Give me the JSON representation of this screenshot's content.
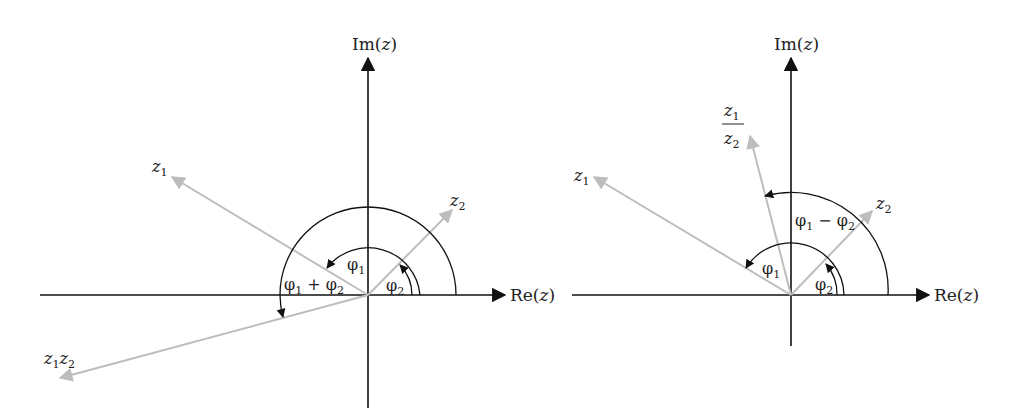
{
  "colors": {
    "axis": "#111111",
    "vector": "#bdbdbd",
    "arc": "#111111",
    "background": "#ffffff"
  },
  "left": {
    "title": "Multiplication of complex numbers",
    "axes": {
      "im_label": "Im(z)",
      "re_label": ""
    },
    "vectors": [
      {
        "name": "z1",
        "label": "z",
        "sub": "1"
      },
      {
        "name": "z2",
        "label": "z",
        "sub": "2"
      },
      {
        "name": "z1z2",
        "label": "z",
        "sub": "1",
        "label2": "z",
        "sub2": "2"
      }
    ],
    "angles": [
      {
        "name": "phi1",
        "label": "φ",
        "sub": "1"
      },
      {
        "name": "phi2",
        "label": "φ",
        "sub": "2"
      },
      {
        "name": "phi1_plus_phi2",
        "label": "φ",
        "sub": "1",
        "op": " + ",
        "label2": "φ",
        "sub2": "2"
      }
    ]
  },
  "right": {
    "title": "Division of complex numbers",
    "axes": {
      "im_label": "Im(z)",
      "re_label": "Re(z)",
      "re_label_left": "Re(z)"
    },
    "vectors": [
      {
        "name": "z1",
        "label": "z",
        "sub": "1"
      },
      {
        "name": "z2",
        "label": "z",
        "sub": "2"
      },
      {
        "name": "z1_over_z2",
        "num": "z",
        "num_sub": "1",
        "den": "z",
        "den_sub": "2"
      }
    ],
    "angles": [
      {
        "name": "phi1",
        "label": "φ",
        "sub": "1"
      },
      {
        "name": "phi2",
        "label": "φ",
        "sub": "2"
      },
      {
        "name": "phi1_minus_phi2",
        "label": "φ",
        "sub": "1",
        "op": " − ",
        "label2": "φ",
        "sub2": "2"
      }
    ]
  }
}
